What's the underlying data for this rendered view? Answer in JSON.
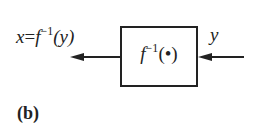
{
  "diagram": {
    "block": {
      "func": "f",
      "sup": "−1",
      "arg": "(•)"
    },
    "output_label": {
      "lhs": "x",
      "eq": "=",
      "func": "f",
      "sup": "−1",
      "arg": "(y)"
    },
    "input_label": "y",
    "caption": "(b)"
  }
}
